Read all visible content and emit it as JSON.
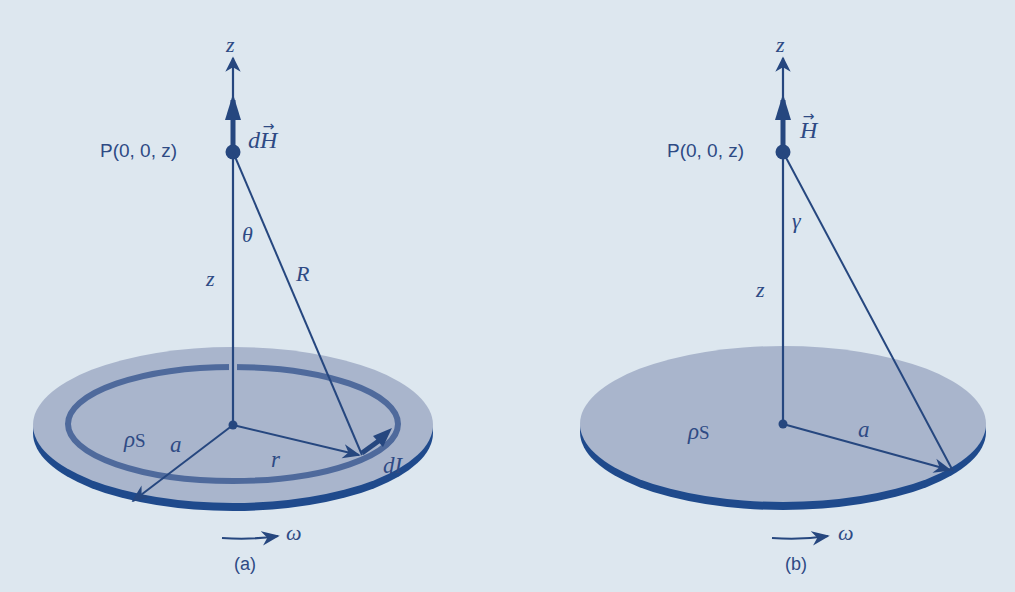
{
  "colors": {
    "background": "#dde7ef",
    "disk_fill": "#a9b5cc",
    "disk_edge": "#1f4a8c",
    "line": "#26477f",
    "ring": "#4f6a9c",
    "text": "#2e4a84"
  },
  "panel_a": {
    "caption": "(a)",
    "axis_label": "z",
    "point_label": "P(0, 0, z)",
    "field_label_prefix": "d",
    "field_label_var": "H",
    "vector_arrow": "→",
    "angle_label": "θ",
    "height_label": "z",
    "distance_label": "R",
    "charge_density_label": "ρ",
    "charge_density_sub": "S",
    "disk_radius_label": "a",
    "ring_radius_label": "r",
    "current_element_label": "dI",
    "rotation_label": "ω"
  },
  "panel_b": {
    "caption": "(b)",
    "axis_label": "z",
    "point_label": "P(0, 0, z)",
    "field_label_var": "H",
    "vector_arrow": "→",
    "angle_label": "γ",
    "height_label": "z",
    "charge_density_label": "ρ",
    "charge_density_sub": "S",
    "disk_radius_label": "a",
    "rotation_label": "ω"
  }
}
